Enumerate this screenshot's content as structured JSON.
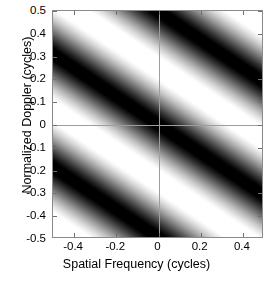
{
  "figure": {
    "kind": "grayscale-heatmap",
    "background": "#ffffff",
    "axis_color": "#8a8a8a",
    "crosshair_color": "#9d9d9d"
  },
  "axes": {
    "x": {
      "title": "Spatial Frequency (cycles)",
      "tick_labels": [
        "-0.4",
        "-0.2",
        "0",
        "0.2",
        "0.4"
      ],
      "tick_values": [
        -0.4,
        -0.2,
        0,
        0.2,
        0.4
      ],
      "limits": [
        -0.5,
        0.5
      ]
    },
    "y": {
      "title": "Normalized Doppler (cycles)",
      "tick_labels": [
        "0.5",
        "0.4",
        "0.3",
        "0.2",
        "0.1",
        "0",
        "-0.1",
        "-0.2",
        "-0.3",
        "-0.4",
        "-0.5"
      ],
      "tick_values": [
        0.5,
        0.4,
        0.3,
        0.2,
        0.1,
        0,
        -0.1,
        -0.2,
        -0.3,
        -0.4,
        -0.5
      ],
      "limits": [
        -0.5,
        0.5
      ]
    }
  },
  "chart_data": {
    "type": "heatmap",
    "title": "",
    "xlabel": "Spatial Frequency (cycles)",
    "ylabel": "Normalized Doppler (cycles)",
    "xlim": [
      -0.5,
      0.5
    ],
    "ylim": [
      -0.5,
      0.5
    ],
    "grid": false,
    "legend": "none",
    "colormap": "gray",
    "colormap_stops": [
      "#000000",
      "#ffffff"
    ],
    "value_range": [
      0,
      1
    ],
    "annotations": [
      "faint gray crosshair at x=0 and y=0",
      "diagonal sinusoidal fringe bands running lower-left to upper-right"
    ],
    "model": {
      "description": "Intensity follows a squared-cosine fringe pattern tilted along a diagonal: I(x,y) = 0.5*(1 - cos(2*pi*(y - slope*x)/period)) mapped through a mild contrast gamma.",
      "fringe_slope": -0.62,
      "fringe_period": 0.5,
      "phase_offset_cycles": 0.0,
      "gamma": 0.72
    },
    "sampled_rows": [
      {
        "y": 0.5,
        "x": [
          -0.5,
          -0.3,
          -0.1,
          0.0,
          0.1,
          0.3,
          0.5
        ],
        "values": [
          0.96,
          0.72,
          0.18,
          0.04,
          0.02,
          0.42,
          0.93
        ]
      },
      {
        "y": 0.27,
        "x": [
          -0.5,
          -0.3,
          -0.1,
          0.0,
          0.1,
          0.3,
          0.5
        ],
        "values": [
          0.05,
          0.38,
          0.88,
          0.98,
          0.96,
          0.62,
          0.12
        ]
      },
      {
        "y": 0.0,
        "x": [
          -0.5,
          -0.3,
          -0.1,
          0.0,
          0.1,
          0.3,
          0.5
        ],
        "values": [
          0.86,
          0.96,
          0.35,
          0.06,
          0.05,
          0.7,
          0.99
        ]
      },
      {
        "y": -0.27,
        "x": [
          -0.5,
          -0.3,
          -0.1,
          0.0,
          0.1,
          0.3,
          0.5
        ],
        "values": [
          0.22,
          0.06,
          0.62,
          0.92,
          0.98,
          0.45,
          0.09
        ]
      },
      {
        "y": -0.5,
        "x": [
          -0.5,
          -0.3,
          -0.1,
          0.0,
          0.1,
          0.3,
          0.5
        ],
        "values": [
          0.95,
          0.7,
          0.16,
          0.04,
          0.03,
          0.44,
          0.92
        ]
      }
    ],
    "sampled_cols": [
      {
        "x": -0.5,
        "y": [
          0.5,
          0.25,
          0.0,
          -0.25,
          -0.5
        ],
        "values": [
          0.96,
          0.04,
          0.86,
          0.18,
          0.95
        ]
      },
      {
        "x": 0.0,
        "y": [
          0.5,
          0.25,
          0.0,
          -0.25,
          -0.5
        ],
        "values": [
          0.04,
          0.98,
          0.06,
          0.94,
          0.04
        ]
      },
      {
        "x": 0.5,
        "y": [
          0.5,
          0.25,
          0.0,
          -0.25,
          -0.5
        ],
        "values": [
          0.93,
          0.12,
          0.99,
          0.1,
          0.92
        ]
      }
    ]
  }
}
